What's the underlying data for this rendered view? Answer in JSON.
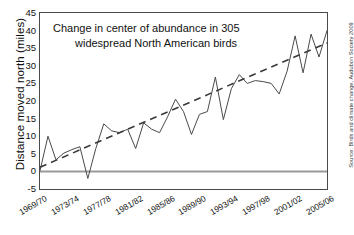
{
  "chart_data": {
    "type": "line",
    "title": "",
    "annotation": {
      "line1": "Change in center of abundance in 305",
      "line2": "widespread North American birds"
    },
    "xlabel": "",
    "ylabel": "Distance moved north  (miles)",
    "ylim": [
      -5,
      45
    ],
    "yticks": [
      -5,
      0,
      5,
      10,
      15,
      20,
      25,
      30,
      35,
      40,
      45
    ],
    "ytick_labels": [
      "-5",
      "0",
      "5",
      "10",
      "15",
      "20",
      "25",
      "30",
      "35",
      "40",
      "45"
    ],
    "xtick_labels": [
      "1969/70",
      "1973/74",
      "1977/78",
      "1981/82",
      "1985/86",
      "1989/90",
      "1993/94",
      "1997/98",
      "2001/02",
      "2005/06"
    ],
    "x": [
      "1969/70",
      "1970/71",
      "1971/72",
      "1972/73",
      "1973/74",
      "1974/75",
      "1975/76",
      "1976/77",
      "1977/78",
      "1978/79",
      "1979/80",
      "1980/81",
      "1981/82",
      "1982/83",
      "1983/84",
      "1984/85",
      "1985/86",
      "1986/87",
      "1987/88",
      "1988/89",
      "1989/90",
      "1990/91",
      "1991/92",
      "1992/93",
      "1993/94",
      "1994/95",
      "1995/96",
      "1996/97",
      "1997/98",
      "1998/99",
      "1999/00",
      "2000/01",
      "2001/02",
      "2002/03",
      "2003/04",
      "2004/05",
      "2005/06"
    ],
    "values": [
      0.2,
      10.0,
      3.3,
      5.2,
      6.2,
      7.0,
      -2.0,
      6.5,
      13.5,
      11.5,
      11.0,
      12.0,
      6.5,
      13.8,
      12.0,
      11.0,
      15.5,
      20.5,
      17.0,
      10.5,
      16.2,
      17.0,
      26.8,
      14.7,
      23.5,
      27.5,
      25.0,
      25.8,
      25.5,
      25.0,
      22.0,
      28.5,
      38.5,
      28.0,
      39.0,
      32.5,
      40.0
    ],
    "grid": false,
    "legend": false,
    "zero_line": true,
    "series": [
      {
        "name": "Distance moved north",
        "style": "solid",
        "color": "#4a4a4a",
        "values": [
          0.2,
          10.0,
          3.3,
          5.2,
          6.2,
          7.0,
          -2.0,
          6.5,
          13.5,
          11.5,
          11.0,
          12.0,
          6.5,
          13.8,
          12.0,
          11.0,
          15.5,
          20.5,
          17.0,
          10.5,
          16.2,
          17.0,
          26.8,
          14.7,
          23.5,
          27.5,
          25.0,
          25.8,
          25.5,
          25.0,
          22.0,
          28.5,
          38.5,
          28.0,
          39.0,
          32.5,
          40.0
        ]
      },
      {
        "name": "Linear trend",
        "style": "dashed",
        "color": "#3a3a3a",
        "endpoints": [
          {
            "x": "1969/70",
            "y": 1.2
          },
          {
            "x": "2005/06",
            "y": 36.5
          }
        ]
      }
    ]
  },
  "source": {
    "text": "Source: Birds and climate change, Audubon Society 2009"
  },
  "colors": {
    "axis": "#4a4a4a",
    "data_line": "#4a4a4a",
    "trend_line": "#3a3a3a",
    "zero_line": "#9a9a9a",
    "text": "#111111",
    "background": "#ffffff"
  }
}
